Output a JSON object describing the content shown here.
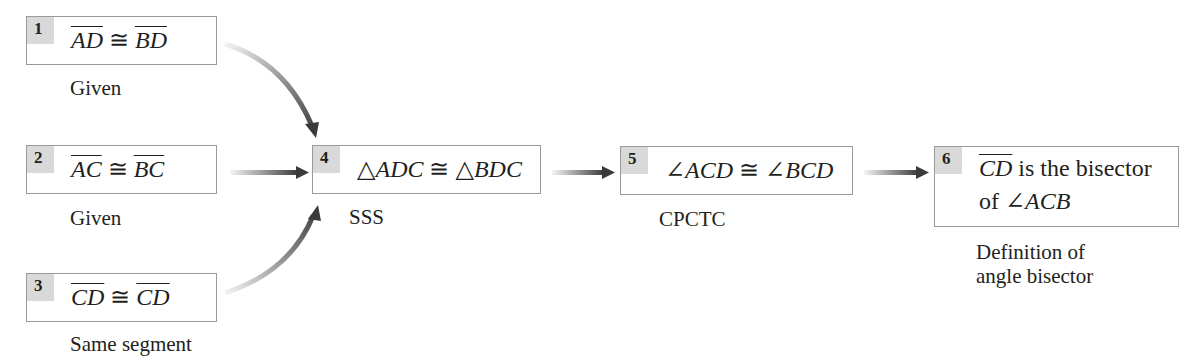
{
  "diagram": {
    "type": "flow-proof",
    "steps": [
      {
        "number": "1",
        "statement_parts": [
          "AD",
          "≅",
          "BD"
        ],
        "reason": "Given"
      },
      {
        "number": "2",
        "statement_parts": [
          "AC",
          "≅",
          "BC"
        ],
        "reason": "Given"
      },
      {
        "number": "3",
        "statement_parts": [
          "CD",
          "≅",
          "CD"
        ],
        "reason": "Same segment"
      },
      {
        "number": "4",
        "statement_parts": [
          "△",
          "ADC",
          "≅",
          "△",
          "BDC"
        ],
        "reason": "SSS"
      },
      {
        "number": "5",
        "statement_parts": [
          "∠",
          "ACD",
          "≅",
          "∠",
          "BCD"
        ],
        "reason": "CPCTC"
      },
      {
        "number": "6",
        "statement_line1_parts": [
          "CD",
          "is the bisector"
        ],
        "statement_line2_parts": [
          "of",
          "∠",
          "ACB"
        ],
        "reason_lines": [
          "Definition of",
          "angle bisector"
        ]
      }
    ],
    "connections": [
      {
        "from": "1",
        "to": "4",
        "shape": "curved"
      },
      {
        "from": "2",
        "to": "4",
        "shape": "straight"
      },
      {
        "from": "3",
        "to": "4",
        "shape": "curved"
      },
      {
        "from": "4",
        "to": "5",
        "shape": "straight"
      },
      {
        "from": "5",
        "to": "6",
        "shape": "straight"
      }
    ],
    "colors": {
      "badge": "#d9d9d9",
      "border": "#9a9a9a",
      "arrow": "#3a3a3a",
      "text": "#231f20"
    }
  }
}
